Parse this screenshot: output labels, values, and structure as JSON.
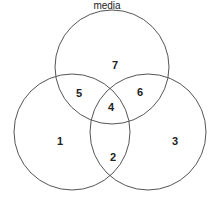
{
  "title": "media",
  "circles": [
    {
      "name": "top",
      "cx": 112,
      "cy": 67,
      "r": 57
    },
    {
      "name": "left",
      "cx": 72,
      "cy": 132,
      "r": 58
    },
    {
      "name": "right",
      "cx": 148,
      "cy": 132,
      "r": 58
    }
  ],
  "regions": [
    {
      "label": "1",
      "x": 60,
      "y": 141
    },
    {
      "label": "2",
      "x": 113,
      "y": 157
    },
    {
      "label": "3",
      "x": 175,
      "y": 141
    },
    {
      "label": "4",
      "x": 111,
      "y": 107
    },
    {
      "label": "5",
      "x": 79,
      "y": 93
    },
    {
      "label": "6",
      "x": 140,
      "y": 92
    },
    {
      "label": "7",
      "x": 115,
      "y": 65
    }
  ],
  "colors": {
    "stroke": "#555555",
    "text": "#222222"
  }
}
